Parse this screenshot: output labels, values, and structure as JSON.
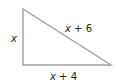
{
  "diagram": {
    "type": "right-triangle",
    "vertices": {
      "top": [
        23,
        9
      ],
      "right_angle": [
        23,
        65
      ],
      "bottom_right": [
        111,
        65
      ]
    },
    "stroke_color": "#a0a0a0",
    "labels": {
      "left_side": {
        "var": "x",
        "rest": ""
      },
      "hypotenuse": {
        "var": "x",
        "rest": " + 6"
      },
      "base": {
        "var": "x",
        "rest": " + 4"
      }
    }
  }
}
